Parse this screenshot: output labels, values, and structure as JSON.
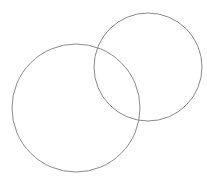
{
  "diagram": {
    "type": "venn",
    "background": "#ffffff",
    "stroke_color": "#8a8a8a",
    "circles": [
      {
        "id": "large-circle",
        "cx": 76,
        "cy": 108,
        "r": 64
      },
      {
        "id": "small-circle",
        "cx": 148,
        "cy": 67,
        "r": 54
      }
    ]
  }
}
